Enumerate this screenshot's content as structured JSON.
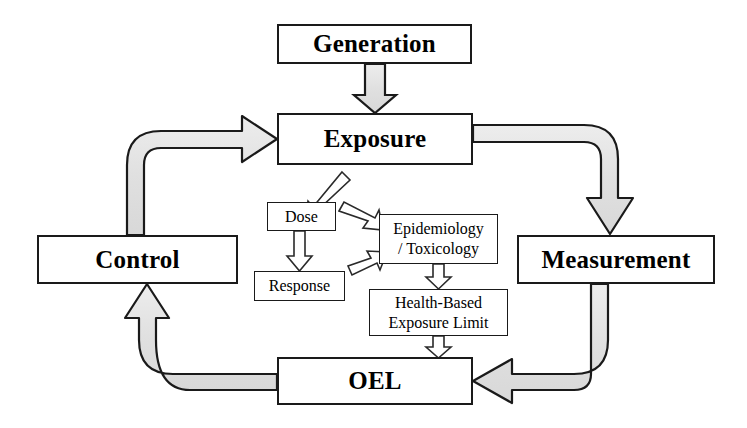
{
  "diagram": {
    "background_color": "#ffffff",
    "outline_color": "#1a1a1a",
    "thick_arrow_fill": "#e2e2e2",
    "thin_arrow_fill": "#ffffff"
  },
  "nodes": {
    "generation": {
      "label": "Generation",
      "style": "major"
    },
    "exposure": {
      "label": "Exposure",
      "style": "major"
    },
    "control": {
      "label": "Control",
      "style": "major"
    },
    "measurement": {
      "label": "Measurement",
      "style": "major"
    },
    "oel": {
      "label": "OEL",
      "style": "major"
    },
    "dose": {
      "label": "Dose",
      "style": "minor"
    },
    "response": {
      "label": "Response",
      "style": "minor"
    },
    "epitox": {
      "label": "Epidemiology\n/ Toxicology",
      "style": "minor"
    },
    "hbel": {
      "label": "Health-Based\nExposure Limit",
      "style": "minor"
    }
  },
  "edges": [
    {
      "name": "generation-to-exposure",
      "from": "generation",
      "to": "exposure",
      "weight": "thick",
      "direction": "down"
    },
    {
      "name": "control-to-exposure",
      "from": "control",
      "to": "exposure",
      "weight": "thick",
      "direction": "up-right"
    },
    {
      "name": "exposure-to-measurement",
      "from": "exposure",
      "to": "measurement",
      "weight": "thick",
      "direction": "right-down"
    },
    {
      "name": "measurement-to-oel",
      "from": "measurement",
      "to": "oel",
      "weight": "thick",
      "direction": "down-left"
    },
    {
      "name": "oel-to-control",
      "from": "oel",
      "to": "control",
      "weight": "thick",
      "direction": "left-up"
    },
    {
      "name": "exposure-to-dose",
      "from": "exposure",
      "to": "dose",
      "weight": "thin",
      "direction": "down-left-diagonal"
    },
    {
      "name": "dose-to-response",
      "from": "dose",
      "to": "response",
      "weight": "thin",
      "direction": "down"
    },
    {
      "name": "dose-to-epitox",
      "from": "dose",
      "to": "epitox",
      "weight": "thin",
      "direction": "right-down-diagonal"
    },
    {
      "name": "response-to-epitox",
      "from": "response",
      "to": "epitox",
      "weight": "thin",
      "direction": "right-up-diagonal"
    },
    {
      "name": "epitox-to-hbel",
      "from": "epitox",
      "to": "hbel",
      "weight": "thin",
      "direction": "down"
    },
    {
      "name": "hbel-to-oel",
      "from": "hbel",
      "to": "oel",
      "weight": "thin",
      "direction": "down"
    }
  ]
}
